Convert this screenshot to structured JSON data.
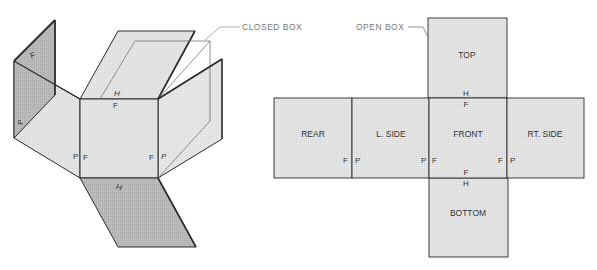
{
  "callouts": {
    "closed_box": "CLOSED BOX",
    "open_box": "OPEN BOX"
  },
  "net": {
    "panels": {
      "top": "TOP",
      "rear": "REAR",
      "left_side": "L. SIDE",
      "front": "FRONT",
      "right_side": "RT. SIDE",
      "bottom": "BOTTOM"
    },
    "fold_marks": {
      "top_h": "H",
      "top_f": "F",
      "rear_f": "F",
      "lside_p_left": "P",
      "lside_p_right": "P",
      "front_f_left": "F",
      "front_f_right": "F",
      "rside_p": "P",
      "bottom_f": "F",
      "bottom_h": "H"
    }
  },
  "iso": {
    "fold_marks": {
      "rear_f": "F",
      "rear_p": "P",
      "top_h": "H",
      "top_f": "F",
      "front_p_left": "P",
      "front_f_left": "F",
      "front_f_right": "F",
      "front_p_right": "P",
      "bottom_h": "H"
    }
  },
  "colors": {
    "light_fill": "#e4e4e4",
    "dark_fill": "#b8b8b8",
    "stroke": "#2a2a2a",
    "callout": "#888888"
  }
}
